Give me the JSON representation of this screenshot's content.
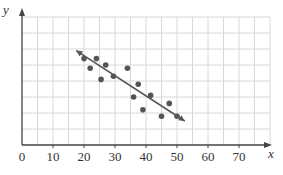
{
  "chart_data": {
    "type": "scatter",
    "title": "",
    "xlabel": "x",
    "ylabel": "y",
    "xlim": [
      0,
      80
    ],
    "ylim": [
      0,
      8
    ],
    "grid": true,
    "x_ticks": [
      0,
      10,
      20,
      30,
      40,
      50,
      60,
      70
    ],
    "y_ticks": [],
    "points": [
      {
        "x": 20,
        "y": 5.4
      },
      {
        "x": 22,
        "y": 4.8
      },
      {
        "x": 24,
        "y": 5.4
      },
      {
        "x": 25.5,
        "y": 4.1
      },
      {
        "x": 27,
        "y": 5.0
      },
      {
        "x": 29.5,
        "y": 4.3
      },
      {
        "x": 34,
        "y": 4.8
      },
      {
        "x": 36,
        "y": 3.0
      },
      {
        "x": 37.5,
        "y": 3.8
      },
      {
        "x": 39,
        "y": 2.2
      },
      {
        "x": 41.5,
        "y": 3.1
      },
      {
        "x": 45,
        "y": 1.8
      },
      {
        "x": 47.5,
        "y": 2.6
      },
      {
        "x": 50,
        "y": 1.8
      }
    ],
    "trend_line": {
      "x1": 17.5,
      "y1": 5.9,
      "x2": 52.5,
      "y2": 1.5,
      "arrows": true
    },
    "colors": {
      "points": "#555555",
      "line": "#555555",
      "grid": "#d8d8d8",
      "axis": "#444444"
    }
  },
  "axes": {
    "x_label": "x",
    "y_label": "y"
  }
}
